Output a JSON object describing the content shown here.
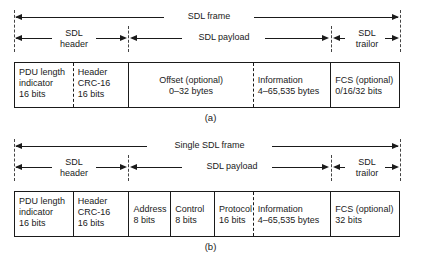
{
  "figures": [
    {
      "id": "a",
      "caption": "(a)",
      "dimensions": [
        {
          "name": "sdl-frame",
          "label": "SDL frame"
        },
        {
          "name": "sdl-header",
          "label": "SDL\nheader"
        },
        {
          "name": "sdl-payload",
          "label": "SDL payload"
        },
        {
          "name": "sdl-trailor",
          "label": "SDL\ntrailor"
        }
      ],
      "fields": [
        {
          "name": "pdu-length-indicator",
          "label": "PDU length\nindicator\n16 bits",
          "align": "left"
        },
        {
          "name": "header-crc-16",
          "label": "Header\nCRC-16\n16 bits",
          "align": "left"
        },
        {
          "name": "offset-optional",
          "label": "Offset (optional)\n0–32 bytes",
          "align": "center"
        },
        {
          "name": "information",
          "label": "Information\n4–65,535 bytes",
          "align": "left"
        },
        {
          "name": "fcs-optional",
          "label": "FCS (optional)\n0/16/32 bits",
          "align": "left"
        }
      ]
    },
    {
      "id": "b",
      "caption": "(b)",
      "dimensions": [
        {
          "name": "single-sdl-frame",
          "label": "Single SDL frame"
        },
        {
          "name": "sdl-header",
          "label": "SDL\nheader"
        },
        {
          "name": "sdl-payload",
          "label": "SDL payload"
        },
        {
          "name": "sdl-trailor",
          "label": "SDL\ntrailor"
        }
      ],
      "fields": [
        {
          "name": "pdu-length-indicator",
          "label": "PDU length\nindicator\n16 bits",
          "align": "left"
        },
        {
          "name": "header-crc-16",
          "label": "Header\nCRC-16\n16 bits",
          "align": "left"
        },
        {
          "name": "address",
          "label": "Address\n8 bits",
          "align": "left"
        },
        {
          "name": "control",
          "label": "Control\n8 bits",
          "align": "left"
        },
        {
          "name": "protocol",
          "label": "Protocol\n16 bits",
          "align": "left"
        },
        {
          "name": "information",
          "label": "Information\n4–65,535 bytes",
          "align": "left"
        },
        {
          "name": "fcs-optional",
          "label": "FCS (optional)\n32 bits",
          "align": "left"
        }
      ]
    }
  ]
}
